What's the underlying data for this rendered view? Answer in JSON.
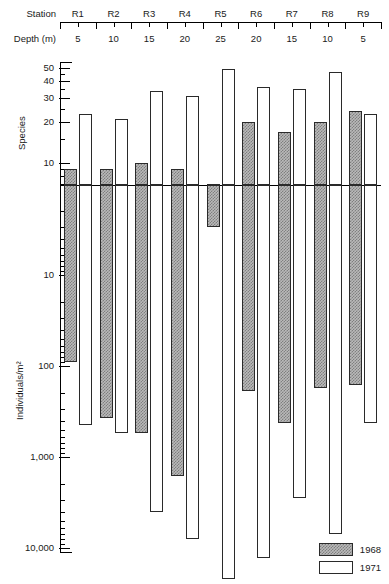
{
  "header": {
    "station_label": "Station",
    "depth_label": "Depth (m)",
    "stations": [
      "R1",
      "R2",
      "R3",
      "R4",
      "R5",
      "R6",
      "R7",
      "R8",
      "R9"
    ],
    "depths": [
      "5",
      "10",
      "15",
      "20",
      "25",
      "20",
      "15",
      "10",
      "5"
    ]
  },
  "legend": {
    "position": "bottom-right",
    "entries": [
      {
        "label": "1968",
        "fill": "hatched-gray",
        "color": "#b9b9b9"
      },
      {
        "label": "1971",
        "fill": "white",
        "color": "#ffffff"
      }
    ]
  },
  "chart_data": {
    "type": "bar",
    "title": "",
    "orientation": "bidirectional-vertical",
    "categories": [
      "R1",
      "R2",
      "R3",
      "R4",
      "R5",
      "R6",
      "R7",
      "R8",
      "R9"
    ],
    "secondary_categories": [
      "5",
      "10",
      "15",
      "20",
      "25",
      "20",
      "15",
      "10",
      "5"
    ],
    "upper_panel": {
      "ylabel": "Species",
      "scale": "log",
      "ticks": [
        10,
        20,
        30,
        40,
        50
      ],
      "ticklabels": [
        "10",
        "20",
        "30",
        "40",
        "50"
      ],
      "direction": "up-from-baseline",
      "series": [
        {
          "name": "1968",
          "values": [
            9,
            9,
            10,
            9,
            7,
            20,
            17,
            20,
            24
          ]
        },
        {
          "name": "1971",
          "values": [
            23,
            21,
            34,
            31,
            49,
            36,
            35,
            47,
            23
          ]
        }
      ]
    },
    "lower_panel": {
      "ylabel": "Individuals/m²",
      "scale": "log-inverted",
      "ticks": [
        10,
        100,
        1000,
        10000
      ],
      "ticklabels": [
        "10",
        "100",
        "1,000",
        "10,000"
      ],
      "direction": "down-from-baseline",
      "series": [
        {
          "name": "1968",
          "values": [
            90,
            370,
            550,
            1600,
            3,
            190,
            420,
            175,
            160
          ]
        },
        {
          "name": "1971",
          "values": [
            450,
            550,
            4000,
            8000,
            22000,
            13000,
            2800,
            7000,
            420
          ]
        }
      ]
    },
    "grid": false,
    "legend_position": "bottom-right"
  }
}
